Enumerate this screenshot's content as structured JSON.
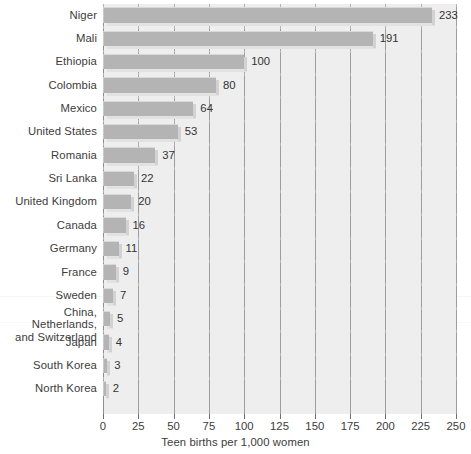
{
  "chart_data": {
    "type": "bar",
    "orientation": "horizontal",
    "title": "",
    "xlabel": "Teen births per 1,000 women",
    "ylabel": "",
    "xlim": [
      0,
      250
    ],
    "xticks": [
      0,
      25,
      50,
      75,
      100,
      125,
      150,
      175,
      200,
      225,
      250
    ],
    "xtick_labels": [
      "0",
      "25",
      "50",
      "75",
      "100",
      "125",
      "150",
      "175",
      "200",
      "225",
      "250"
    ],
    "grid": true,
    "legend": null,
    "categories": [
      "Niger",
      "Mali",
      "Ethiopia",
      "Colombia",
      "Mexico",
      "United States",
      "Romania",
      "Sri Lanka",
      "United Kingdom",
      "Canada",
      "Germany",
      "France",
      "Sweden",
      "China, Netherlands,\nand Switzerland",
      "Japan",
      "South Korea",
      "North Korea"
    ],
    "values": [
      233,
      191,
      100,
      80,
      64,
      53,
      37,
      22,
      20,
      16,
      11,
      9,
      7,
      5,
      4,
      3,
      2
    ],
    "value_labels": [
      "233",
      "191",
      "100",
      "80",
      "64",
      "53",
      "37",
      "22",
      "20",
      "16",
      "11",
      "9",
      "7",
      "5",
      "4",
      "3",
      "2"
    ],
    "colors": {
      "bar_fill": "#b4b4b4",
      "bar_highlight": "#d9d9d9",
      "bar_shadow": "#d2d2d2",
      "plot_background": "#eeeeee",
      "gridline": "#9d9d9d",
      "text": "#3c3c3c",
      "page_background": "#ffffff"
    }
  }
}
